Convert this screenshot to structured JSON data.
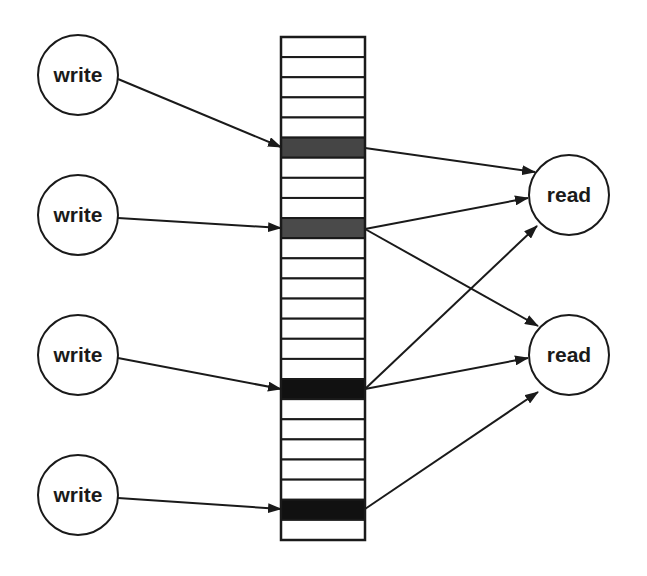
{
  "diagram": {
    "buffer": {
      "x": 281,
      "y": 37,
      "width": 84,
      "row_height": 20.12,
      "row_count": 25,
      "highlighted_rows": [
        {
          "index": 5,
          "color": "#454545"
        },
        {
          "index": 9,
          "color": "#4a4a4a"
        },
        {
          "index": 17,
          "color": "#111111"
        },
        {
          "index": 23,
          "color": "#111111"
        }
      ]
    },
    "nodes": [
      {
        "id": "write1",
        "label": "write",
        "cx": 78,
        "cy": 75,
        "r": 40
      },
      {
        "id": "write2",
        "label": "write",
        "cx": 78,
        "cy": 215,
        "r": 40
      },
      {
        "id": "write3",
        "label": "write",
        "cx": 78,
        "cy": 355,
        "r": 40
      },
      {
        "id": "write4",
        "label": "write",
        "cx": 78,
        "cy": 495,
        "r": 40
      },
      {
        "id": "read1",
        "label": "read",
        "cx": 569,
        "cy": 195,
        "r": 40
      },
      {
        "id": "read2",
        "label": "read",
        "cx": 569,
        "cy": 355,
        "r": 40
      }
    ],
    "edges": [
      {
        "from": "write1",
        "to": "buffer-row-5",
        "x1": 118,
        "y1": 79,
        "x2": 281,
        "y2": 147
      },
      {
        "from": "write2",
        "to": "buffer-row-9",
        "x1": 118,
        "y1": 218,
        "x2": 281,
        "y2": 228
      },
      {
        "from": "write3",
        "to": "buffer-row-17",
        "x1": 118,
        "y1": 358,
        "x2": 281,
        "y2": 389
      },
      {
        "from": "write4",
        "to": "buffer-row-23",
        "x1": 118,
        "y1": 498,
        "x2": 281,
        "y2": 509
      },
      {
        "from": "buffer-row-5",
        "to": "read1",
        "x1": 365,
        "y1": 148,
        "x2": 535,
        "y2": 172
      },
      {
        "from": "buffer-row-9",
        "to": "read1",
        "x1": 365,
        "y1": 229,
        "x2": 528,
        "y2": 198
      },
      {
        "from": "buffer-row-9",
        "to": "read2",
        "x1": 365,
        "y1": 229,
        "x2": 538,
        "y2": 326
      },
      {
        "from": "buffer-row-17",
        "to": "read1",
        "x1": 365,
        "y1": 389,
        "x2": 537,
        "y2": 226
      },
      {
        "from": "buffer-row-17",
        "to": "read2",
        "x1": 365,
        "y1": 389,
        "x2": 528,
        "y2": 358
      },
      {
        "from": "buffer-row-23",
        "to": "read2",
        "x1": 365,
        "y1": 509,
        "x2": 538,
        "y2": 392
      }
    ],
    "colors": {
      "stroke": "#1a1a1a",
      "background": "#ffffff",
      "cell_fill": "#ffffff"
    }
  }
}
